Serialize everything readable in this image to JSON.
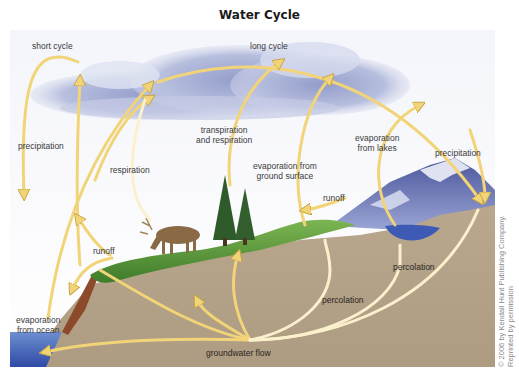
{
  "title": "Water Cycle",
  "labels": {
    "short_cycle": "short cycle",
    "long_cycle": "long cycle",
    "precipitation_left": "precipitation",
    "precipitation_right": "precipitation",
    "respiration": "respiration",
    "transpiration_line1": "transpiration",
    "transpiration_line2": "and respiration",
    "evap_ground_line1": "evaporation from",
    "evap_ground_line2": "ground surface",
    "evap_lakes_line1": "evaporation",
    "evap_lakes_line2": "from lakes",
    "runoff_left": "runoff",
    "runoff_right": "runoff",
    "evap_ocean_line1": "evaporation",
    "evap_ocean_line2": "from ocean",
    "percolation_left": "percolation",
    "percolation_right": "percolation",
    "groundwater_flow": "groundwater flow"
  },
  "credit": {
    "line1": "© 2006 by Kendall Hunt Publishing Company.",
    "line2": "Reprinted by permission"
  },
  "colors": {
    "arrow": "#f2d478",
    "arrow_outline": "#c9a540",
    "sky_cloud": "#a9b3d6",
    "ground": "#b7a58c",
    "grass": "#5c9a3a",
    "ocean": "#3f5fb0",
    "lake": "#3d5bb5",
    "mountain": "#6e78b8"
  }
}
